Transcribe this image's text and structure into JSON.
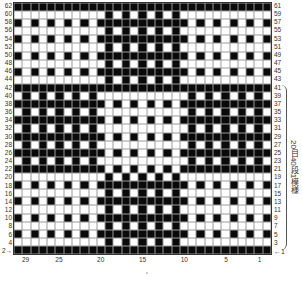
{
  "chart_data": {
    "type": "heatmap",
    "columns": 31,
    "rows": 31,
    "legend": {
      "1": "black stitch",
      "0": "white stitch"
    },
    "colors": {
      "black": "#0a0a0a",
      "white": "#ffffff",
      "grid": "#9a9a9a"
    },
    "row_labels_left": [
      "62",
      "60",
      "58",
      "56",
      "54",
      "52",
      "50",
      "48",
      "46",
      "44",
      "42",
      "40",
      "38",
      "36",
      "34",
      "32",
      "30",
      "28",
      "26",
      "24",
      "22",
      "20",
      "18",
      "16",
      "14",
      "12",
      "10",
      "8",
      "6",
      "4",
      "2"
    ],
    "row_labels_right": [
      "61",
      "59",
      "57",
      "55",
      "53",
      "51",
      "49",
      "47",
      "45",
      "43",
      "41",
      "39",
      "37",
      "35",
      "33",
      "31",
      "29",
      "27",
      "25",
      "23",
      "21",
      "19",
      "17",
      "15",
      "13",
      "11",
      "9",
      "7",
      "5",
      "3",
      "1"
    ],
    "column_labels": [
      {
        "label": "29",
        "col_index": 1
      },
      {
        "label": "25",
        "col_index": 5
      },
      {
        "label": "20",
        "col_index": 10
      },
      {
        "label": "15",
        "col_index": 15
      },
      {
        "label": "10",
        "col_index": 20
      },
      {
        "label": "5",
        "col_index": 25
      },
      {
        "label": "1",
        "col_index": 29
      }
    ],
    "grid": [
      "1111111111111111111111111111111",
      "0000000000010101010100000000000",
      "1010101010111111111110101010101",
      "0000000000010101010100000000000",
      "1010101010111111111110101010101",
      "0000000000010101010100000000000",
      "1010101010111111111110101010101",
      "0000000000010101010100000000000",
      "1010101010111111111110101010101",
      "0000000000010101010100000000000",
      "1111111111111111111111111111111",
      "0101010101000000000001010101010",
      "1111111111101010101011111111111",
      "0101010101000000000001010101010",
      "1111111111101010101011111111111",
      "0101010101000000000001010101010",
      "1111111111101010101011111111111",
      "0101010101000000000001010101010",
      "1111111111101010101011111111111",
      "0101010101000000000001010101010",
      "1111111111101010101011111111111",
      "0000000000010101010100000000000",
      "1010101010111111111110101010101",
      "0000000000010101010100000000000",
      "1010101010111111111110101010101",
      "0000000000010101010100000000000",
      "1010101010111111111110101010101",
      "0000000000010101010100000000000",
      "1010101010111111111110101010101",
      "0000000000010101010100000000000",
      "1111111111111111111111111111111"
    ],
    "annotations": {
      "repeat_note": "20目40段1模様",
      "start_arrow_left": "2→",
      "start_arrow_right": "←1"
    }
  }
}
